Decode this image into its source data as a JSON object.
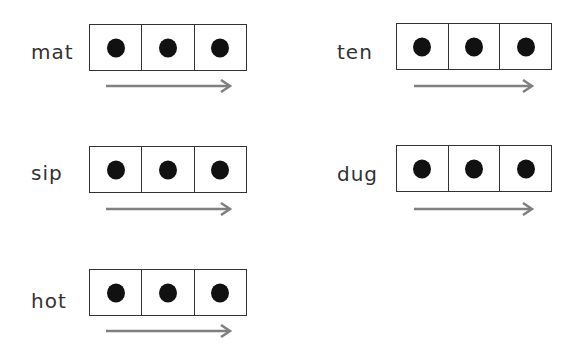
{
  "worksheet": {
    "items": [
      {
        "word": "mat",
        "boxes": 3,
        "dots": 3
      },
      {
        "word": "ten",
        "boxes": 3,
        "dots": 3
      },
      {
        "word": "sip",
        "boxes": 3,
        "dots": 3
      },
      {
        "word": "dug",
        "boxes": 3,
        "dots": 3
      },
      {
        "word": "hot",
        "boxes": 3,
        "dots": 3
      }
    ],
    "colors": {
      "line": "#333333",
      "dot": "#111111",
      "arrow": "#808080"
    }
  }
}
